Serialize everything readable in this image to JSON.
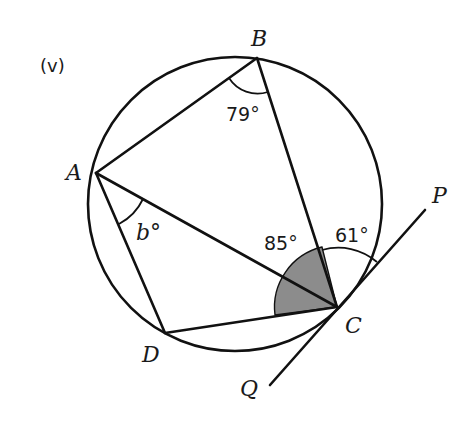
{
  "figure": {
    "part_label": "(v)",
    "points": {
      "A": {
        "label": "A",
        "x": 96,
        "y": 173
      },
      "B": {
        "label": "B",
        "x": 257,
        "y": 58
      },
      "C": {
        "label": "C",
        "x": 337,
        "y": 307
      },
      "D": {
        "label": "D",
        "x": 165,
        "y": 333
      },
      "P": {
        "label": "P",
        "x": 425,
        "y": 210
      },
      "Q": {
        "label": "Q",
        "x": 270,
        "y": 385
      }
    },
    "circle": {
      "cx": 235,
      "cy": 204,
      "r": 147
    },
    "angles": {
      "ABC": "79°",
      "BAC": "b°",
      "DCB": "85°",
      "BCP": "61°"
    },
    "colors": {
      "line": "#111111",
      "shade": "#8c8c8c",
      "background": "#ffffff"
    }
  }
}
